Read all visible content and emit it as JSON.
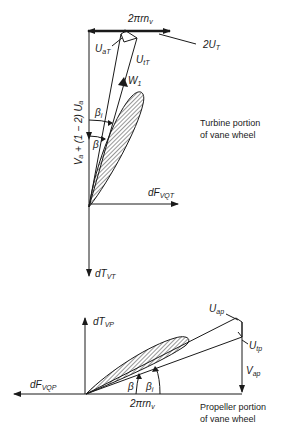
{
  "turbine": {
    "caption_line1": "Turbine portion",
    "caption_line2": "of vane wheel",
    "top_velocity": {
      "main": "2πrn",
      "sub": "v"
    },
    "u_at": {
      "main": "U",
      "sub": "aT"
    },
    "u_tt": {
      "main": "U",
      "sub": "tT"
    },
    "two_ut": {
      "main": "2U",
      "sub": "T"
    },
    "w1": {
      "main": "W",
      "sub": "1"
    },
    "beta_i": {
      "main": "β",
      "sub": "i"
    },
    "beta": {
      "main": "β"
    },
    "axial_label": "Vₐ + (1 − 2) Uₐ",
    "force_q": {
      "main": "dF",
      "sub": "VQT"
    },
    "thrust": {
      "main": "dT",
      "sub": "VT"
    }
  },
  "propeller": {
    "caption_line1": "Propeller portion",
    "caption_line2": "of vane wheel",
    "thrust": {
      "main": "dT",
      "sub": "VP"
    },
    "force_q": {
      "main": "dF",
      "sub": "VQP"
    },
    "u_ap": {
      "main": "U",
      "sub": "ap"
    },
    "u_tp": {
      "main": "U",
      "sub": "tp"
    },
    "v_ap": {
      "main": "V",
      "sub": "ap"
    },
    "beta": {
      "main": "β"
    },
    "beta_i": {
      "main": "β",
      "sub": "i"
    },
    "bottom_velocity": {
      "main": "2πrn",
      "sub": "v"
    }
  }
}
